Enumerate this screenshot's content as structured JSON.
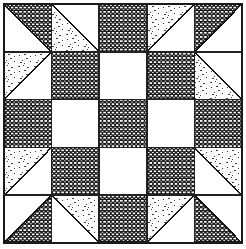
{
  "figure": {
    "width": 246,
    "height": 249
  },
  "canvas": {
    "background_color": "#ffffff",
    "margin_left": 4,
    "margin_top": 4,
    "margin_right": 4,
    "margin_bottom": 6,
    "block_x": 4,
    "block_y": 4,
    "block_width": 238,
    "block_height": 239,
    "border_color": "#1a1a1a",
    "border_width": 2,
    "grid_line_color": "#222222",
    "grid_line_width": 1.6
  },
  "grid": {
    "rows": 5,
    "columns": 5,
    "cell_width": 47.6,
    "cell_height": 47.8
  },
  "fabrics": {
    "white": {
      "name": "plain-white",
      "label": "Plain white fabric",
      "color": "#ffffff"
    },
    "dark_dot": {
      "name": "dark-dotted",
      "label": "Dark print with white dot grid",
      "color": "#1c1c1c",
      "dot_color": "#ffffff",
      "dot_spacing": 4.2
    },
    "stipple": {
      "name": "light-stipple",
      "label": "Light fabric with sparse stipple marks",
      "color": "#fdfdfd",
      "mark_color": "#3a3a3a",
      "mark_spacing": 8
    }
  },
  "legend": {
    "entries": [
      {
        "key": "white",
        "label": "Plain white fabric"
      },
      {
        "key": "dark_dot",
        "label": "Dark dotted print"
      },
      {
        "key": "stipple",
        "label": "Light stipple print"
      }
    ]
  },
  "cells": [
    {
      "name": "cell-r0-c0",
      "row": 0,
      "col": 0,
      "kind": "half-square-triangle",
      "diagonal": "tl-br",
      "fill_a": "white",
      "fill_b": "dark_dot"
    },
    {
      "name": "cell-r0-c1",
      "row": 0,
      "col": 1,
      "kind": "half-square-triangle",
      "diagonal": "tl-br",
      "fill_a": "stipple",
      "fill_b": "white"
    },
    {
      "name": "cell-r0-c2",
      "row": 0,
      "col": 2,
      "kind": "solid",
      "diagonal": "none",
      "fill_a": "dark_dot",
      "fill_b": "dark_dot"
    },
    {
      "name": "cell-r0-c3",
      "row": 0,
      "col": 3,
      "kind": "half-square-triangle",
      "diagonal": "bl-tr",
      "fill_a": "stipple",
      "fill_b": "white"
    },
    {
      "name": "cell-r0-c4",
      "row": 0,
      "col": 4,
      "kind": "half-square-triangle",
      "diagonal": "bl-tr",
      "fill_a": "dark_dot",
      "fill_b": "white"
    },
    {
      "name": "cell-r1-c0",
      "row": 1,
      "col": 0,
      "kind": "half-square-triangle",
      "diagonal": "bl-tr",
      "fill_a": "stipple",
      "fill_b": "white"
    },
    {
      "name": "cell-r1-c1",
      "row": 1,
      "col": 1,
      "kind": "solid",
      "diagonal": "none",
      "fill_a": "dark_dot",
      "fill_b": "dark_dot"
    },
    {
      "name": "cell-r1-c2",
      "row": 1,
      "col": 2,
      "kind": "solid",
      "diagonal": "none",
      "fill_a": "white",
      "fill_b": "white"
    },
    {
      "name": "cell-r1-c3",
      "row": 1,
      "col": 3,
      "kind": "solid",
      "diagonal": "none",
      "fill_a": "dark_dot",
      "fill_b": "dark_dot"
    },
    {
      "name": "cell-r1-c4",
      "row": 1,
      "col": 4,
      "kind": "half-square-triangle",
      "diagonal": "tl-br",
      "fill_a": "stipple",
      "fill_b": "white"
    },
    {
      "name": "cell-r2-c0",
      "row": 2,
      "col": 0,
      "kind": "solid",
      "diagonal": "none",
      "fill_a": "dark_dot",
      "fill_b": "dark_dot"
    },
    {
      "name": "cell-r2-c1",
      "row": 2,
      "col": 1,
      "kind": "solid",
      "diagonal": "none",
      "fill_a": "white",
      "fill_b": "white"
    },
    {
      "name": "cell-r2-c2",
      "row": 2,
      "col": 2,
      "kind": "solid",
      "diagonal": "none",
      "fill_a": "dark_dot",
      "fill_b": "dark_dot"
    },
    {
      "name": "cell-r2-c3",
      "row": 2,
      "col": 3,
      "kind": "solid",
      "diagonal": "none",
      "fill_a": "white",
      "fill_b": "white"
    },
    {
      "name": "cell-r2-c4",
      "row": 2,
      "col": 4,
      "kind": "solid",
      "diagonal": "none",
      "fill_a": "dark_dot",
      "fill_b": "dark_dot"
    },
    {
      "name": "cell-r3-c0",
      "row": 3,
      "col": 0,
      "kind": "half-square-triangle",
      "diagonal": "bl-tr",
      "fill_a": "stipple",
      "fill_b": "white"
    },
    {
      "name": "cell-r3-c1",
      "row": 3,
      "col": 1,
      "kind": "solid",
      "diagonal": "none",
      "fill_a": "dark_dot",
      "fill_b": "dark_dot"
    },
    {
      "name": "cell-r3-c2",
      "row": 3,
      "col": 2,
      "kind": "solid",
      "diagonal": "none",
      "fill_a": "white",
      "fill_b": "white"
    },
    {
      "name": "cell-r3-c3",
      "row": 3,
      "col": 3,
      "kind": "solid",
      "diagonal": "none",
      "fill_a": "dark_dot",
      "fill_b": "dark_dot"
    },
    {
      "name": "cell-r3-c4",
      "row": 3,
      "col": 4,
      "kind": "half-square-triangle",
      "diagonal": "tl-br",
      "fill_a": "white",
      "fill_b": "stipple"
    },
    {
      "name": "cell-r4-c0",
      "row": 4,
      "col": 0,
      "kind": "half-square-triangle",
      "diagonal": "bl-tr",
      "fill_a": "white",
      "fill_b": "dark_dot"
    },
    {
      "name": "cell-r4-c1",
      "row": 4,
      "col": 1,
      "kind": "half-square-triangle",
      "diagonal": "tl-br",
      "fill_a": "white",
      "fill_b": "stipple"
    },
    {
      "name": "cell-r4-c2",
      "row": 4,
      "col": 2,
      "kind": "solid",
      "diagonal": "none",
      "fill_a": "dark_dot",
      "fill_b": "dark_dot"
    },
    {
      "name": "cell-r4-c3",
      "row": 4,
      "col": 3,
      "kind": "half-square-triangle",
      "diagonal": "bl-tr",
      "fill_a": "stipple",
      "fill_b": "white"
    },
    {
      "name": "cell-r4-c4",
      "row": 4,
      "col": 4,
      "kind": "half-square-triangle",
      "diagonal": "tl-br",
      "fill_a": "dark_dot",
      "fill_b": "white"
    }
  ]
}
